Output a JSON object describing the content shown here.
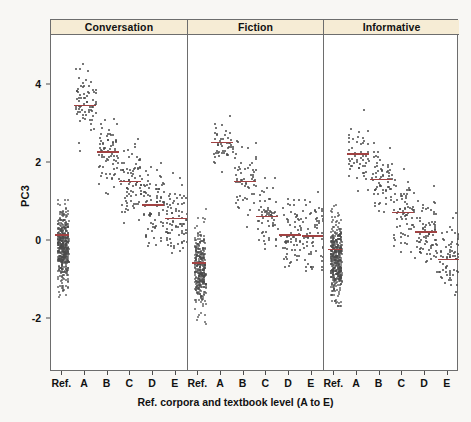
{
  "chart_data": {
    "type": "scatter",
    "title": "",
    "xlabel": "Ref. corpora and textbook level (A to E)",
    "ylabel": "PC3",
    "ylim": [
      -3.6,
      5.4
    ],
    "yticks": [
      4,
      2,
      0,
      -2
    ],
    "ytick_labels": [
      "4",
      "2",
      "0",
      "-2"
    ],
    "grid": false,
    "legend": "none",
    "panel_labels": [
      "Conversation",
      "Fiction",
      "Informative"
    ],
    "categories": [
      "Ref.",
      "A",
      "B",
      "C",
      "D",
      "E"
    ],
    "note": "Strip/jitter plot of PC3 scores by reference corpora and textbook level, faceted by register. Red horizontal bars mark group medians.",
    "colors": {
      "point": "#4a4a4a",
      "median": "#a14242",
      "panel_header": "#f6ecd5",
      "frame": "#6d6d6d",
      "background": "#f8f7f4"
    },
    "panels": [
      {
        "label": "Conversation",
        "groups": [
          {
            "category": "Ref.",
            "median": 0.18,
            "n": 440,
            "spread": [
              -2.6,
              2.2
            ],
            "core": [
              -1.2,
              0.9
            ]
          },
          {
            "category": "A",
            "median": 3.5,
            "n": 70,
            "spread": [
              1.4,
              5.2
            ],
            "core": [
              2.6,
              4.4
            ]
          },
          {
            "category": "B",
            "median": 2.3,
            "n": 75,
            "spread": [
              -0.6,
              4.6
            ],
            "core": [
              1.3,
              3.3
            ]
          },
          {
            "category": "C",
            "median": 1.55,
            "n": 80,
            "spread": [
              -1.6,
              4.3
            ],
            "core": [
              0.5,
              2.6
            ]
          },
          {
            "category": "D",
            "median": 0.95,
            "n": 80,
            "spread": [
              -2.2,
              3.8
            ],
            "core": [
              -0.2,
              2.1
            ]
          },
          {
            "category": "E",
            "median": 0.6,
            "n": 78,
            "spread": [
              -2.0,
              3.5
            ],
            "core": [
              -0.5,
              1.8
            ]
          }
        ]
      },
      {
        "label": "Fiction",
        "groups": [
          {
            "category": "Ref.",
            "median": -0.55,
            "n": 330,
            "spread": [
              -3.4,
              1.7
            ],
            "core": [
              -1.8,
              0.4
            ]
          },
          {
            "category": "A",
            "median": 2.55,
            "n": 48,
            "spread": [
              0.9,
              4.2
            ],
            "core": [
              1.8,
              3.3
            ]
          },
          {
            "category": "B",
            "median": 1.55,
            "n": 60,
            "spread": [
              -1.0,
              3.8
            ],
            "core": [
              0.6,
              2.6
            ]
          },
          {
            "category": "C",
            "median": 0.65,
            "n": 62,
            "spread": [
              -2.0,
              3.0
            ],
            "core": [
              -0.3,
              1.7
            ]
          },
          {
            "category": "D",
            "median": 0.18,
            "n": 70,
            "spread": [
              -2.4,
              2.7
            ],
            "core": [
              -0.8,
              1.2
            ]
          },
          {
            "category": "E",
            "median": 0.15,
            "n": 66,
            "spread": [
              -2.3,
              2.9
            ],
            "core": [
              -0.9,
              1.3
            ]
          }
        ]
      },
      {
        "label": "Informative",
        "groups": [
          {
            "category": "Ref.",
            "median": -0.2,
            "n": 420,
            "spread": [
              -3.6,
              2.1
            ],
            "core": [
              -1.6,
              0.8
            ]
          },
          {
            "category": "A",
            "median": 2.25,
            "n": 52,
            "spread": [
              0.4,
              4.4
            ],
            "core": [
              1.3,
              3.2
            ]
          },
          {
            "category": "B",
            "median": 1.6,
            "n": 66,
            "spread": [
              -1.0,
              3.9
            ],
            "core": [
              0.6,
              2.6
            ]
          },
          {
            "category": "C",
            "median": 0.75,
            "n": 72,
            "spread": [
              -2.0,
              3.2
            ],
            "core": [
              -0.3,
              1.8
            ]
          },
          {
            "category": "D",
            "median": 0.25,
            "n": 74,
            "spread": [
              -2.4,
              2.8
            ],
            "core": [
              -0.8,
              1.3
            ]
          },
          {
            "category": "E",
            "median": -0.45,
            "n": 70,
            "spread": [
              -2.9,
              2.2
            ],
            "core": [
              -1.4,
              0.7
            ]
          }
        ]
      }
    ]
  }
}
